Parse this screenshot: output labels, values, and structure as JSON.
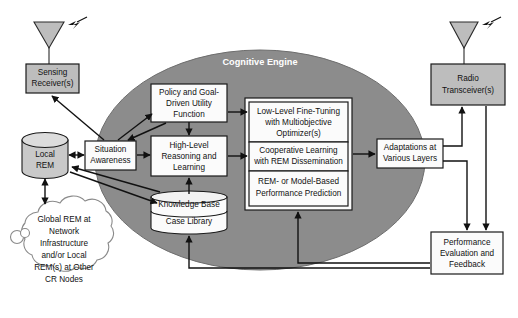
{
  "diagram": {
    "title": "Cognitive Engine",
    "nodes": {
      "sensing_receiver": {
        "line1": "Sensing",
        "line2": "Receiver(s)"
      },
      "radio_transceiver": {
        "line1": "Radio",
        "line2": "Transceiver(s)"
      },
      "local_rem": {
        "line1": "Local",
        "line2": "REM"
      },
      "global_rem_cloud": {
        "line1": "Global REM at",
        "line2": "Network",
        "line3": "Infrastructure",
        "line4": "and/or Local",
        "line5": "REM(s) at Other",
        "line6": "CR Nodes"
      },
      "situation_awareness": {
        "line1": "Situation",
        "line2": "Awareness"
      },
      "policy_utility": {
        "line1": "Policy and Goal-",
        "line2": "Driven Utility",
        "line3": "Function"
      },
      "high_level_reasoning": {
        "line1": "High-Level",
        "line2": "Reasoning and",
        "line3": "Learning"
      },
      "knowledge_base": {
        "line1": "Knowledge Base"
      },
      "case_library": {
        "line1": "Case Library"
      },
      "low_level_tuning": {
        "line1": "Low-Level Fine-Tuning",
        "line2": "with Multiobjective",
        "line3": "Optimizer(s)"
      },
      "cooperative_learning": {
        "line1": "Cooperative Learning",
        "line2": "with REM Dissemination"
      },
      "performance_prediction": {
        "line1": "REM- or Model-Based",
        "line2": "Performance Prediction"
      },
      "adaptations": {
        "line1": "Adaptations at",
        "line2": "Various Layers"
      },
      "performance_eval": {
        "line1": "Performance",
        "line2": "Evaluation and",
        "line3": "Feedback"
      }
    },
    "icons": {
      "left_antenna": "antenna-icon",
      "right_antenna": "antenna-icon",
      "left_signal": "rf-signal-icon",
      "right_signal": "rf-signal-icon"
    },
    "colors": {
      "engine_fill": "#8c8c8c",
      "gray_box_fill": "#bdbdbd",
      "white_box_fill": "#fbfbfb",
      "cylinder_fill": "#c9c9c9",
      "stroke": "#1a1a1a",
      "title_text": "#ffffff"
    }
  }
}
